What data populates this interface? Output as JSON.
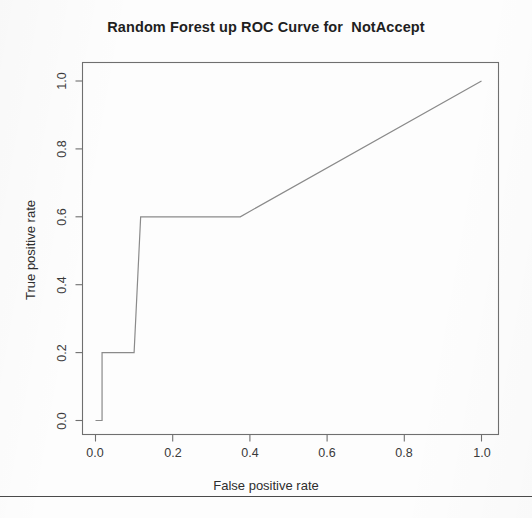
{
  "page": {
    "background_color": "#fdfdfd",
    "width": 532,
    "height": 518
  },
  "chart_title": "Random Forest up ROC Curve for  NotAccept",
  "axis": {
    "x_label": "False positive rate",
    "y_label": "True positive rate",
    "x_ticks": [
      "0.0",
      "0.2",
      "0.4",
      "0.6",
      "0.8",
      "1.0"
    ],
    "y_ticks": [
      "0.0",
      "0.2",
      "0.4",
      "0.6",
      "0.8",
      "1.0"
    ]
  },
  "colors": {
    "line": "#8a8a8a",
    "axis": "#6f6f6f",
    "text": "#2b2b2b",
    "rule": "#4a4a4a"
  },
  "chart_data": {
    "type": "line",
    "title": "Random Forest up ROC Curve for  NotAccept",
    "xlabel": "False positive rate",
    "ylabel": "True positive rate",
    "xlim": [
      0.0,
      1.0
    ],
    "ylim": [
      0.0,
      1.0
    ],
    "grid": false,
    "legend": null,
    "xticks": [
      0.0,
      0.2,
      0.4,
      0.6,
      0.8,
      1.0
    ],
    "yticks": [
      0.0,
      0.2,
      0.4,
      0.6,
      0.8,
      1.0
    ],
    "series": [
      {
        "name": "ROC curve",
        "color": "#8a8a8a",
        "style": "step-then-diagonal",
        "x": [
          0.0,
          0.017,
          0.017,
          0.1,
          0.117,
          0.375,
          1.0
        ],
        "y": [
          0.0,
          0.0,
          0.2,
          0.2,
          0.6,
          0.6,
          1.0
        ]
      }
    ]
  }
}
